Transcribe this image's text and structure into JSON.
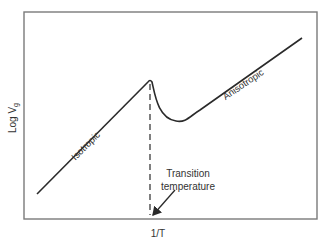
{
  "diagram": {
    "y_axis_label": "Log V",
    "y_axis_subscript": "g",
    "x_axis_label": "1/T",
    "curve_labels": {
      "left": "Isotropic",
      "right": "Anisotropic"
    },
    "annotation": {
      "line1": "Transition",
      "line2": "temperature"
    },
    "colors": {
      "frame": "#6e6e6e",
      "curve": "#2a2a2a",
      "text": "#333333"
    }
  }
}
